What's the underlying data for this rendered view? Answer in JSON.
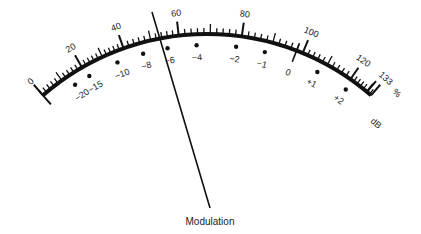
{
  "meter": {
    "title": "Modulation",
    "percent_unit": "%",
    "db_unit": "dB",
    "center": [
      207,
      284
    ],
    "radius": 250,
    "arc_color": "#111111",
    "percent_scale": [
      {
        "value": "0",
        "angle": -41
      },
      {
        "value": "20",
        "angle": -30
      },
      {
        "value": "40",
        "angle": -19.5
      },
      {
        "value": "60",
        "angle": -6.5
      },
      {
        "value": "80",
        "angle": 8
      },
      {
        "value": "100",
        "angle": 22.5
      },
      {
        "value": "120",
        "angle": 35
      },
      {
        "value": "133",
        "angle": 41
      }
    ],
    "db_scale": [
      {
        "value": "−20",
        "angle": -33.5
      },
      {
        "value": "−15",
        "angle": -29.5
      },
      {
        "value": "−10",
        "angle": -22
      },
      {
        "value": "−8",
        "angle": -15.5
      },
      {
        "value": "−6",
        "angle": -9.5
      },
      {
        "value": "−4",
        "angle": -2.5
      },
      {
        "value": "−2",
        "angle": 7
      },
      {
        "value": "−1",
        "angle": 14
      },
      {
        "value": "0",
        "angle": 21
      },
      {
        "value": "+1",
        "angle": 27.5
      },
      {
        "value": "+2",
        "angle": 35.5
      }
    ],
    "needle": {
      "x1": 152,
      "y1": 12,
      "x2": 210,
      "y2": 208
    }
  }
}
